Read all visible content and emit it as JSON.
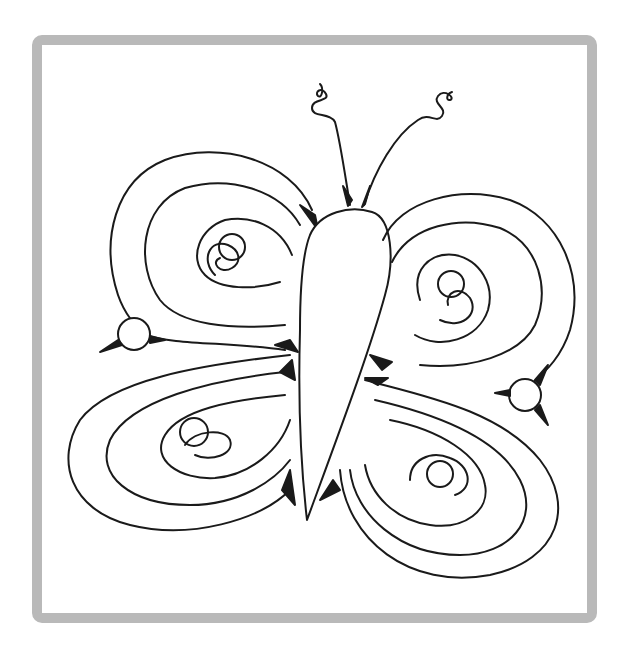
{
  "image": {
    "subject": "butterfly coloring page",
    "frame_color": "#b9b9b9",
    "line_color": "#1a1a1a",
    "fill_color": "#ffffff"
  }
}
